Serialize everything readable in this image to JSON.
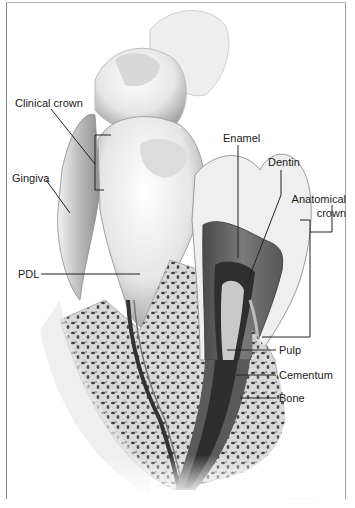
{
  "figure": {
    "labels": {
      "clinical_crown": "Clinical crown",
      "gingiva": "Gingiva",
      "pdl": "PDL",
      "enamel": "Enamel",
      "dentin": "Dentin",
      "anatomical_crown_line1": "Anatomical",
      "anatomical_crown_line2": "crown",
      "pulp": "Pulp",
      "cementum": "Cementum",
      "bone": "Bone"
    },
    "caption": "···· ·· ·",
    "colors": {
      "frame": "#8a8a8a",
      "leader_line": "#222222",
      "enamel": "#e9e9e9",
      "dentin": "#6a6a6a",
      "pulp": "#3a3a3a",
      "bone": "#cfcfcf",
      "gingiva": "#b9b9b9"
    }
  }
}
